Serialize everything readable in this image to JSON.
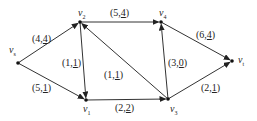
{
  "diagram": {
    "type": "network-flow",
    "nodes": [
      {
        "id": "vs",
        "name": "v",
        "sub": "s",
        "x": 18,
        "y": 63,
        "lx": 9,
        "ly": 45
      },
      {
        "id": "v2",
        "name": "v",
        "sub": "2",
        "x": 80,
        "y": 22,
        "lx": 78,
        "ly": 8
      },
      {
        "id": "v4",
        "name": "v",
        "sub": "4",
        "x": 161,
        "y": 22,
        "lx": 159,
        "ly": 8
      },
      {
        "id": "vt",
        "name": "v",
        "sub": "t",
        "x": 232,
        "y": 61,
        "lx": 238,
        "ly": 55
      },
      {
        "id": "v1",
        "name": "v",
        "sub": "1",
        "x": 86,
        "y": 100,
        "lx": 83,
        "ly": 104
      },
      {
        "id": "v3",
        "name": "v",
        "sub": "3",
        "x": 168,
        "y": 99,
        "lx": 170,
        "ly": 104
      }
    ],
    "edges": [
      {
        "from": "vs",
        "to": "v2",
        "cap": "4",
        "flow": "4",
        "lx": 32,
        "ly": 34
      },
      {
        "from": "vs",
        "to": "v1",
        "cap": "5",
        "flow": "1",
        "lx": 32,
        "ly": 83
      },
      {
        "from": "v2",
        "to": "v1",
        "cap": "1",
        "flow": "1",
        "lx": 62,
        "ly": 58
      },
      {
        "from": "v3",
        "to": "v2",
        "cap": "1",
        "flow": "1",
        "lx": 104,
        "ly": 70
      },
      {
        "from": "v2",
        "to": "v4",
        "cap": "5",
        "flow": "4",
        "lx": 110,
        "ly": 8
      },
      {
        "from": "v1",
        "to": "v3",
        "cap": "2",
        "flow": "2",
        "lx": 115,
        "ly": 103
      },
      {
        "from": "v3",
        "to": "v4",
        "cap": "3",
        "flow": "0",
        "lx": 168,
        "ly": 58
      },
      {
        "from": "v4",
        "to": "vt",
        "cap": "6",
        "flow": "4",
        "lx": 196,
        "ly": 30
      },
      {
        "from": "v3",
        "to": "vt",
        "cap": "2",
        "flow": "1",
        "lx": 201,
        "ly": 83
      }
    ]
  }
}
